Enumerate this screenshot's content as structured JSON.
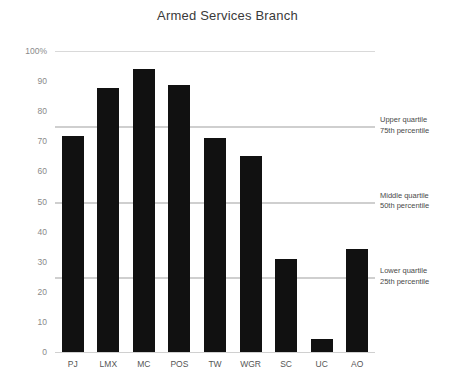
{
  "chart_data": {
    "type": "bar",
    "title": "Armed Services Branch",
    "xlabel": "",
    "ylabel": "",
    "categories": [
      "PJ",
      "LMX",
      "MC",
      "POS",
      "TW",
      "WGR",
      "SC",
      "UC",
      "AO"
    ],
    "values": [
      71.8,
      87.7,
      94.0,
      88.7,
      71.0,
      65.1,
      30.9,
      4.3,
      34.2
    ],
    "ylim": [
      0,
      100
    ],
    "ytick_labels": [
      "0",
      "10",
      "20",
      "30",
      "40",
      "50",
      "60",
      "70",
      "80",
      "90",
      "100%"
    ],
    "ytick_values": [
      0,
      10,
      20,
      30,
      40,
      50,
      60,
      70,
      80,
      90,
      100
    ],
    "grid": true,
    "gridlines_at": [
      0,
      25,
      50,
      75,
      100
    ],
    "legend_position": "none",
    "bar_color": "#111111",
    "gridline_color": "#d9d9d9",
    "annotations": [
      {
        "value": 75,
        "line1": "Upper quartile",
        "line2": "75th percentile",
        "name": "upper-quartile"
      },
      {
        "value": 50,
        "line1": "Middle quartile",
        "line2": "50th percentile",
        "name": "middle-quartile"
      },
      {
        "value": 25,
        "line1": "Lower quartile",
        "line2": "25th percentile",
        "name": "lower-quartile"
      }
    ]
  }
}
